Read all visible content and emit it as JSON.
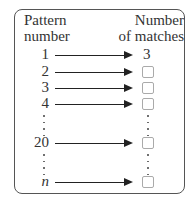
{
  "headers": {
    "left": [
      "Pattern",
      "number"
    ],
    "right": [
      "Number",
      "of matches"
    ]
  },
  "rows": [
    {
      "pattern": "1",
      "matches": "3",
      "blank": false
    },
    {
      "pattern": "2",
      "matches": "",
      "blank": true
    },
    {
      "pattern": "3",
      "matches": "",
      "blank": true
    },
    {
      "pattern": "4",
      "matches": "",
      "blank": true
    },
    {
      "pattern": "20",
      "matches": "",
      "blank": true
    },
    {
      "pattern": "n",
      "matches": "",
      "blank": true
    }
  ],
  "ellipsis_symbol": "⋮",
  "colors": {
    "line": "#222222",
    "frame": "#555555",
    "answer_box": "#aaaaaa"
  }
}
